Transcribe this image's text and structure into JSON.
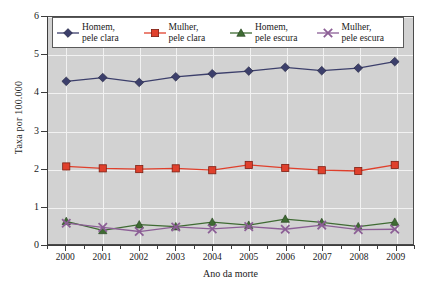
{
  "chart_data": {
    "type": "line",
    "title": "",
    "xlabel": "Ano da morte",
    "ylabel": "Taxa por 100.000",
    "categories": [
      "2000",
      "2001",
      "2002",
      "2003",
      "2004",
      "2005",
      "2006",
      "2007",
      "2008",
      "2009"
    ],
    "xtick_labels": [
      "2000",
      "2001",
      "2002",
      "2003",
      "2004",
      "2005",
      "2006",
      "2007",
      "2008",
      "2009"
    ],
    "ytick_labels": [
      "0",
      "1",
      "2",
      "3",
      "4",
      "5",
      "6"
    ],
    "ytick_values": [
      0,
      1,
      2,
      3,
      4,
      5,
      6
    ],
    "ylim": [
      0,
      6
    ],
    "grid": true,
    "legend_position": "top-inside",
    "plot_background": "#d2d2d2",
    "gridline_color": "#f2f2f2",
    "series": [
      {
        "name": "Homem, pele clara",
        "label_line1": "Homem,",
        "label_line2": "pele clara",
        "color": "#3c3f6b",
        "marker": "diamond",
        "values": [
          4.3,
          4.4,
          4.27,
          4.42,
          4.5,
          4.57,
          4.67,
          4.58,
          4.65,
          4.82
        ]
      },
      {
        "name": "Mulher, pele clara",
        "label_line1": "Mulher,",
        "label_line2": "pele clara",
        "color": "#e0402c",
        "marker": "square",
        "values": [
          2.05,
          2.0,
          1.98,
          2.0,
          1.95,
          2.09,
          2.01,
          1.95,
          1.93,
          2.09
        ]
      },
      {
        "name": "Homem, pele escura",
        "label_line1": "Homem,",
        "label_line2": "pele escura",
        "color": "#3f6b33",
        "marker": "triangle",
        "values": [
          0.6,
          0.36,
          0.51,
          0.46,
          0.58,
          0.5,
          0.66,
          0.57,
          0.46,
          0.58
        ]
      },
      {
        "name": "Mulher, pele escura",
        "label_line1": "Mulher,",
        "label_line2": "pele escura",
        "color": "#8c5f96",
        "marker": "x",
        "values": [
          0.55,
          0.44,
          0.33,
          0.45,
          0.4,
          0.46,
          0.39,
          0.5,
          0.38,
          0.39
        ]
      }
    ]
  }
}
